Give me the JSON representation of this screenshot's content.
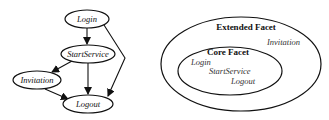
{
  "graph": {
    "nodes": [
      {
        "id": "login",
        "label": "Login"
      },
      {
        "id": "startservice",
        "label": "StartService"
      },
      {
        "id": "invitation",
        "label": "Invitation"
      },
      {
        "id": "logout",
        "label": "Logout"
      }
    ],
    "edges": [
      {
        "from": "Login",
        "to": "StartService"
      },
      {
        "from": "Login",
        "to": "Logout"
      },
      {
        "from": "StartService",
        "to": "Invitation"
      },
      {
        "from": "StartService",
        "to": "Logout"
      },
      {
        "from": "Invitation",
        "to": "Logout"
      }
    ]
  },
  "facets": {
    "extended": {
      "title": "Extended Facet",
      "items": [
        "Invitation"
      ]
    },
    "core": {
      "title": "Core Facet",
      "items": [
        "Login",
        "StartService",
        "Logout"
      ]
    }
  }
}
